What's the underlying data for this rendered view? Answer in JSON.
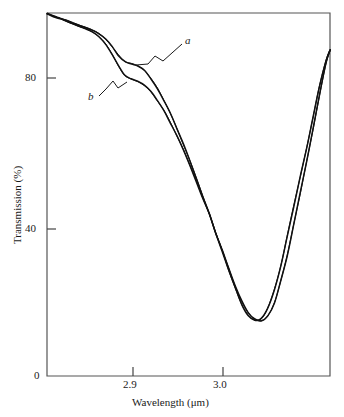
{
  "chart_data": {
    "type": "line",
    "title": "",
    "subtitle": "",
    "xlabel": "Wavelength (μm)",
    "ylabel": "Transmission (%)",
    "xlim": [
      2.851,
      3.069
    ],
    "ylim": [
      0,
      96.5
    ],
    "grid": false,
    "legend_position": "inline-annotations",
    "xticks": [
      2.9,
      3.0
    ],
    "xtick_labels": [
      "2.9",
      "3.0"
    ],
    "yticks": [
      0,
      40,
      80
    ],
    "ytick_labels": [
      "0",
      "40",
      "80"
    ],
    "annotations": [
      {
        "name": "a",
        "text": "a",
        "target_x": 2.918,
        "target_y": 83.0
      },
      {
        "name": "b",
        "text": "b",
        "target_x": 2.905,
        "target_y": 79.0
      }
    ],
    "series": [
      {
        "name": "a",
        "label": "a",
        "color": "#111111",
        "x": [
          2.851,
          2.856,
          2.861,
          2.866,
          2.871,
          2.876,
          2.881,
          2.886,
          2.891,
          2.896,
          2.901,
          2.906,
          2.911,
          2.916,
          2.921,
          2.926,
          2.931,
          2.936,
          2.941,
          2.946,
          2.951,
          2.956,
          2.961,
          2.966,
          2.971,
          2.976,
          2.981,
          2.986,
          2.991,
          2.996,
          3.001,
          3.006,
          3.011,
          3.016,
          3.021,
          3.026,
          3.031,
          3.036,
          3.041,
          3.046,
          3.051,
          3.056,
          3.061,
          3.066,
          3.069
        ],
        "y": [
          96.3,
          95.7,
          95.2,
          94.6,
          93.9,
          93.2,
          92.6,
          92.0,
          91.0,
          89.6,
          87.6,
          85.3,
          83.6,
          83.0,
          82.5,
          81.2,
          79.1,
          76.4,
          73.3,
          69.7,
          65.8,
          61.6,
          57.2,
          52.6,
          47.9,
          43.1,
          38.2,
          33.2,
          28.2,
          23.3,
          19.0,
          16.2,
          14.9,
          15.3,
          18.0,
          23.0,
          29.5,
          37.0,
          45.0,
          53.0,
          61.0,
          69.0,
          77.0,
          84.0,
          86.8
        ]
      },
      {
        "name": "b",
        "label": "b",
        "color": "#111111",
        "x": [
          2.851,
          2.856,
          2.861,
          2.866,
          2.871,
          2.876,
          2.881,
          2.886,
          2.891,
          2.896,
          2.901,
          2.906,
          2.911,
          2.916,
          2.921,
          2.926,
          2.931,
          2.936,
          2.941,
          2.946,
          2.951,
          2.956,
          2.961,
          2.966,
          2.971,
          2.976,
          2.981,
          2.986,
          2.991,
          2.996,
          3.001,
          3.006,
          3.011,
          3.016,
          3.021,
          3.026,
          3.031,
          3.036,
          3.041,
          3.046,
          3.051,
          3.056,
          3.061,
          3.066,
          3.069
        ],
        "y": [
          96.3,
          95.6,
          95.0,
          94.3,
          93.6,
          92.9,
          92.2,
          91.4,
          90.2,
          88.3,
          85.6,
          82.4,
          79.9,
          78.9,
          78.4,
          77.3,
          75.6,
          73.3,
          70.6,
          67.4,
          63.9,
          60.1,
          56.1,
          51.8,
          47.4,
          42.9,
          38.2,
          33.4,
          28.6,
          23.9,
          19.8,
          16.8,
          15.2,
          14.7,
          16.0,
          19.5,
          25.0,
          32.0,
          40.0,
          48.5,
          57.0,
          65.5,
          74.5,
          83.0,
          86.5
        ]
      }
    ]
  },
  "axes": {
    "x_axis_name": "wavelength-axis",
    "y_axis_name": "transmission-axis"
  }
}
